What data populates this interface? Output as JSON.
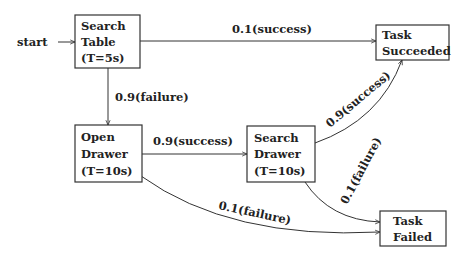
{
  "diagram": {
    "type": "state-transition",
    "start_label": "start",
    "nodes": [
      {
        "id": "search_table",
        "lines": [
          "Search",
          "Table",
          "(T=5s)"
        ]
      },
      {
        "id": "open_drawer",
        "lines": [
          "Open",
          "Drawer",
          "(T=10s)"
        ]
      },
      {
        "id": "search_drawer",
        "lines": [
          "Search",
          "Drawer",
          "(T=10s)"
        ]
      },
      {
        "id": "task_succeeded",
        "lines": [
          "Task",
          "Succeeded"
        ]
      },
      {
        "id": "task_failed",
        "lines": [
          "Task",
          "Failed"
        ]
      }
    ],
    "edges": [
      {
        "from": "search_table",
        "to": "task_succeeded",
        "label": "0.1(success)"
      },
      {
        "from": "search_table",
        "to": "open_drawer",
        "label": "0.9(failure)"
      },
      {
        "from": "open_drawer",
        "to": "search_drawer",
        "label": "0.9(success)"
      },
      {
        "from": "search_drawer",
        "to": "task_succeeded",
        "label": "0.9(success)"
      },
      {
        "from": "search_drawer",
        "to": "task_failed",
        "label": "0.1(failure)"
      },
      {
        "from": "open_drawer",
        "to": "task_failed",
        "label": "0.1(failure)"
      }
    ]
  }
}
